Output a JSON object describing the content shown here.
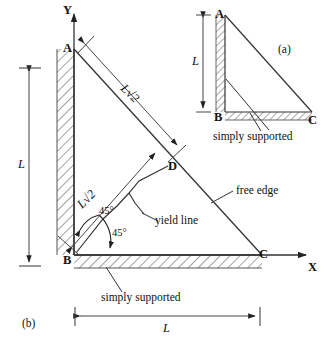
{
  "figure": {
    "panels": {
      "inset_label": "(a)",
      "main_label": "(b)"
    },
    "axes": {
      "x_label": "X",
      "y_label": "Y"
    },
    "main_plate": {
      "vertices": {
        "A": "A",
        "B": "B",
        "C": "C",
        "D": "D"
      },
      "dimensions": {
        "vertical_L": "L",
        "horizontal_L": "L",
        "diagonal_AD": "L√2",
        "diagonal_BD": "L√2"
      },
      "angles": {
        "upper": "45°",
        "lower": "45°"
      },
      "annotations": {
        "yield_line": "yield line",
        "free_edge": "free edge",
        "simply_supported": "simply supported"
      }
    },
    "inset_plate": {
      "vertices": {
        "A": "A",
        "B": "B",
        "C": "C"
      },
      "dimensions": {
        "vertical_L": "L"
      },
      "annotations": {
        "simply_supported": "simply supported"
      }
    },
    "colors": {
      "ink": "#1a1a1a",
      "line": "#333333",
      "hatch": "#555555",
      "background": "#ffffff"
    }
  }
}
